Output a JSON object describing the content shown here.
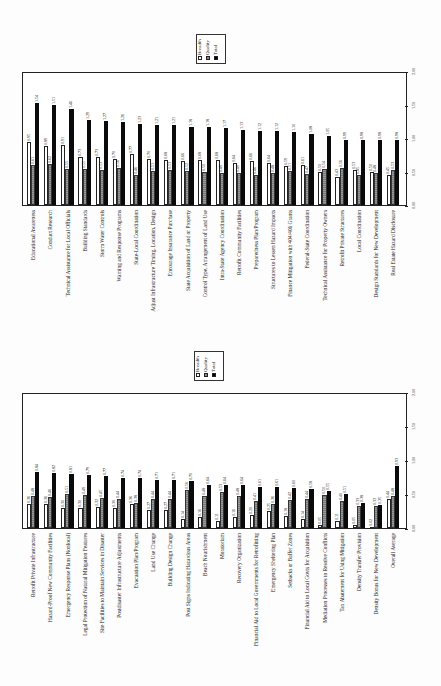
{
  "legend": {
    "breadth": "Breadth",
    "quality": "Quality",
    "total": "Total"
  },
  "axis": {
    "ticks": [
      "0.00",
      "0.50",
      "1.00",
      "1.50",
      "2.00"
    ]
  },
  "chart_data": [
    {
      "type": "bar",
      "title": "",
      "orientation": "rotated page (bars read upward when page rotated 90° clockwise)",
      "xlabel": "",
      "ylabel": "",
      "ylim": [
        0,
        2.0
      ],
      "yticks": [
        0.0,
        0.5,
        1.0,
        1.5,
        2.0
      ],
      "legend_position": "top-center",
      "categories": [
        "Educational Awareness",
        "Conduct Research",
        "Technical Assistance for Local Officials",
        "Building Standards",
        "Storm Water Controls",
        "Warning and Response Programs",
        "State-Local Coordination",
        "Adjust Infrastructure Timing, Location, Design",
        "Encourage Insurance Purchase",
        "State Acquisition of Land or Property",
        "Control Type, Arrangement of Land Use",
        "Intra-State Agency Coordination",
        "Retrofit Community Facilities",
        "Preparedness Plan/Program",
        "Structures to Lessen Hazard Impacts",
        "Finance Mitigation with 404/406 Grants",
        "Federal-State Coordination",
        "Technical Assistance for Property Owners",
        "Retrofit Private Structures",
        "Local Coordination",
        "Design Standards for New Development",
        "Real Estate Hazard Disclosure"
      ],
      "series": [
        {
          "name": "Breadth",
          "values": [
            0.95,
            0.89,
            0.91,
            0.73,
            0.73,
            0.7,
            0.77,
            0.7,
            0.68,
            0.66,
            0.68,
            0.68,
            0.64,
            0.66,
            0.64,
            0.59,
            0.61,
            0.5,
            0.43,
            0.53,
            0.5,
            0.45
          ]
        },
        {
          "name": "Quality",
          "values": [
            0.61,
            0.62,
            0.55,
            0.55,
            0.53,
            0.56,
            0.46,
            0.51,
            0.53,
            0.52,
            0.5,
            0.49,
            0.49,
            0.46,
            0.48,
            0.51,
            0.47,
            0.54,
            0.56,
            0.45,
            0.48,
            0.53
          ]
        },
        {
          "name": "Total",
          "values": [
            1.54,
            1.51,
            1.46,
            1.29,
            1.27,
            1.26,
            1.23,
            1.21,
            1.21,
            1.18,
            1.18,
            1.17,
            1.13,
            1.12,
            1.12,
            1.1,
            1.08,
            1.05,
            0.99,
            0.98,
            0.98,
            0.98
          ]
        }
      ]
    },
    {
      "type": "bar",
      "title": "",
      "xlabel": "",
      "ylabel": "",
      "ylim": [
        0,
        2.0
      ],
      "yticks": [
        0.0,
        0.5,
        1.0,
        1.5,
        2.0
      ],
      "legend_position": "top-center",
      "categories": [
        "Retrofit Private Infrastructure",
        "Hazard-Proof New Community Facilities",
        "Emergency Response Plans (Nonlocal)",
        "Legal Protection of Natural Mitigation Features",
        "Site Facilities to Maintain Services in Disaster",
        "Postdisaster Infrastructure Adjustments",
        "Evacuation Plan/Program",
        "Land Use Change",
        "Building Design Change",
        "Post Signs Indicating Hazardous Areas",
        "Beach Nourishment",
        "Moratorium",
        "Recovery Organization",
        "Financial Aid to Local Governments for Retrofitting",
        "Emergency Sheltering Plan",
        "Setbacks or Buffer Zones",
        "Financial Aid to Local Govts for Acquisition",
        "Mediation Processes to Resolve Conflicts",
        "Tax Abatement for Using Mitigation",
        "Density Transfer Provision",
        "Density Bonus for New Development",
        "Overall Average"
      ],
      "series": [
        {
          "name": "Breadth",
          "values": [
            0.36,
            0.36,
            0.3,
            0.3,
            0.32,
            0.3,
            0.36,
            0.27,
            0.27,
            0.14,
            0.16,
            0.11,
            0.16,
            0.2,
            0.25,
            0.18,
            0.14,
            0.05,
            0.11,
            0.05,
            0.02,
            0.44
          ]
        },
        {
          "name": "Quality",
          "values": [
            0.48,
            0.46,
            0.51,
            0.49,
            0.45,
            0.44,
            0.38,
            0.44,
            0.44,
            0.56,
            0.48,
            0.53,
            0.48,
            0.41,
            0.36,
            0.42,
            0.44,
            0.5,
            0.4,
            0.33,
            0.33,
            0.48
          ]
        },
        {
          "name": "Total",
          "values": [
            0.84,
            0.82,
            0.81,
            0.79,
            0.77,
            0.74,
            0.74,
            0.71,
            0.71,
            0.7,
            0.64,
            0.64,
            0.64,
            0.61,
            0.61,
            0.6,
            0.58,
            0.55,
            0.51,
            0.38,
            0.35,
            0.93
          ]
        }
      ]
    }
  ]
}
